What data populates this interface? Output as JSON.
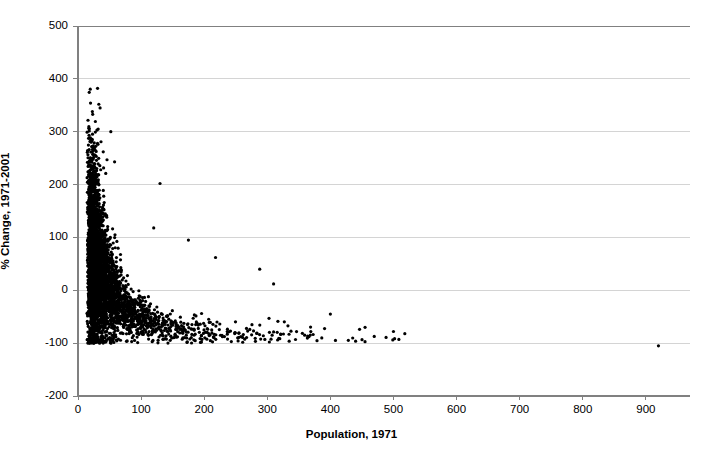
{
  "chart_data": {
    "type": "scatter",
    "title": "",
    "xlabel": "Population, 1971",
    "ylabel": "% Change, 1971-2001",
    "xlim": [
      0,
      970
    ],
    "ylim": [
      -200,
      500
    ],
    "xticks": [
      0,
      100,
      200,
      300,
      400,
      500,
      600,
      700,
      800,
      900
    ],
    "yticks": [
      -200,
      -100,
      0,
      100,
      200,
      300,
      400,
      500
    ],
    "xtick_labels": [
      "0",
      "100",
      "200",
      "300",
      "400",
      "500",
      "600",
      "700",
      "800",
      "900"
    ],
    "ytick_labels": [
      "-200",
      "-100",
      "0",
      "100",
      "200",
      "300",
      "400",
      "500"
    ],
    "grid": "horizontal",
    "legend": "none",
    "marker": {
      "shape": "circle",
      "color": "#000000",
      "size_px": 3.2
    },
    "point_count_approx": 4200,
    "notable_points": [
      {
        "x": 31,
        "y": 382
      },
      {
        "x": 33,
        "y": 352
      },
      {
        "x": 35,
        "y": 345
      },
      {
        "x": 32,
        "y": 305
      },
      {
        "x": 52,
        "y": 300
      },
      {
        "x": 40,
        "y": 262
      },
      {
        "x": 46,
        "y": 247
      },
      {
        "x": 58,
        "y": 243
      },
      {
        "x": 36,
        "y": 228
      },
      {
        "x": 44,
        "y": 221
      },
      {
        "x": 130,
        "y": 202
      },
      {
        "x": 120,
        "y": 118
      },
      {
        "x": 175,
        "y": 95
      },
      {
        "x": 218,
        "y": 62
      },
      {
        "x": 288,
        "y": 40
      },
      {
        "x": 310,
        "y": 12
      },
      {
        "x": 400,
        "y": -45
      },
      {
        "x": 455,
        "y": -70
      },
      {
        "x": 500,
        "y": -78
      },
      {
        "x": 518,
        "y": -82
      },
      {
        "x": 920,
        "y": -105
      }
    ],
    "colors": {
      "marker": "#000000",
      "axis": "#808080",
      "gridline": "#d4d4d4",
      "background": "#ffffff",
      "text": "#000000"
    },
    "geometry": {
      "plot_left_px": 78,
      "plot_right_px": 690,
      "plot_top_px": 26,
      "plot_bottom_px": 396
    }
  }
}
